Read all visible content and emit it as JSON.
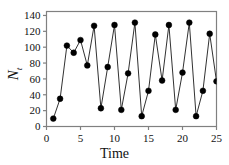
{
  "chart_data": {
    "type": "line",
    "title": "",
    "subtitle": "",
    "xlabel": "Time",
    "ylabel": "N_t",
    "ylabel_base": "N",
    "ylabel_sub": "t",
    "x": [
      1,
      2,
      3,
      4,
      5,
      6,
      7,
      8,
      9,
      10,
      11,
      12,
      13,
      14,
      15,
      16,
      17,
      18,
      19,
      20,
      21,
      22,
      23,
      24,
      25
    ],
    "values": [
      10,
      35,
      102,
      93,
      109,
      77,
      127,
      23,
      75,
      128,
      21,
      67,
      131,
      13,
      45,
      116,
      58,
      128,
      21,
      68,
      131,
      13,
      45,
      117,
      57
    ],
    "series": [
      {
        "name": "N_t",
        "values": [
          10,
          35,
          102,
          93,
          109,
          77,
          127,
          23,
          75,
          128,
          21,
          67,
          131,
          13,
          45,
          116,
          58,
          128,
          21,
          68,
          131,
          13,
          45,
          117,
          57
        ]
      }
    ],
    "xlim": [
      0,
      25
    ],
    "ylim": [
      0,
      145
    ],
    "xticks": [
      0,
      5,
      10,
      15,
      20,
      25
    ],
    "yticks": [
      0,
      20,
      40,
      60,
      80,
      100,
      120,
      140
    ],
    "xtick_labels": [
      "0",
      "5",
      "10",
      "15",
      "20",
      "25"
    ],
    "ytick_labels": [
      "0",
      "20",
      "40",
      "60",
      "80",
      "100",
      "120",
      "140"
    ],
    "grid": false,
    "legend": null,
    "marker": "filled-circle",
    "marker_color": "#000000",
    "line_color": "#1a1a1a",
    "axis_color": "#808080",
    "background": "#ffffff"
  }
}
